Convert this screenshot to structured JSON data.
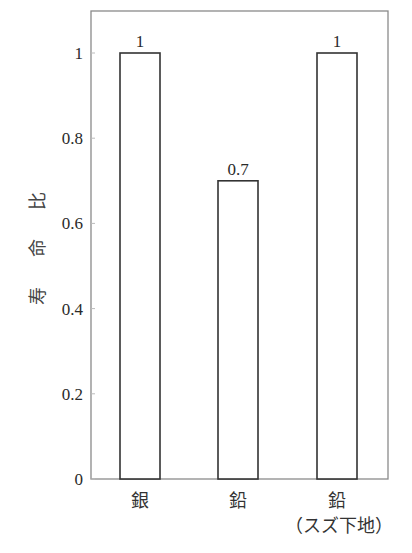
{
  "chart_data": {
    "type": "bar",
    "title": "",
    "xlabel": "",
    "ylabel": "寿命比",
    "categories": [
      "銀",
      "鉛",
      "鉛\n（スズ下地）"
    ],
    "category_lines": [
      [
        "銀"
      ],
      [
        "鉛"
      ],
      [
        "鉛",
        "（スズ下地）"
      ]
    ],
    "values": [
      1,
      0.7,
      1
    ],
    "data_labels": [
      "1",
      "0.7",
      "1"
    ],
    "ylim": [
      0,
      1.1
    ],
    "yticks": [
      0,
      0.2,
      0.4,
      0.6,
      0.8,
      1
    ],
    "ytick_labels": [
      "0",
      "0.2",
      "0.4",
      "0.6",
      "0.8",
      "1"
    ],
    "grid": false,
    "legend": null,
    "bar_fill": "#ffffff",
    "bar_edge": "#333333"
  }
}
